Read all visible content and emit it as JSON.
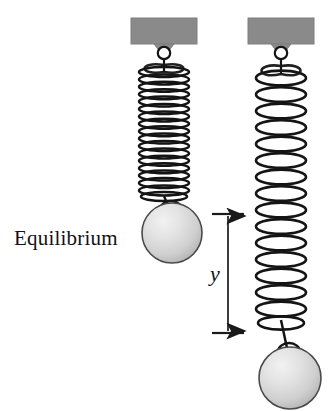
{
  "figure": {
    "background_color": "#ffffff",
    "width": 334,
    "height": 411
  },
  "labels": {
    "equilibrium": "Equilibrium",
    "displacement": "y"
  },
  "colors": {
    "support_block": "#8a8a8a",
    "support_block_edge": "#7d7d7d",
    "spring_stroke": "#141414",
    "ball_fill_light": "#ececec",
    "ball_fill_mid": "#d4d4d4",
    "ball_fill_dark": "#b4b4b4",
    "ball_outline": "#4a4a4a",
    "dimension_line": "#1a1a1a",
    "text": "#111111"
  },
  "systems": [
    {
      "name": "equilibrium-system",
      "state": "equilibrium",
      "support": {
        "x": 131,
        "y": 18,
        "width": 66,
        "height": 26
      },
      "hook": {
        "cx": 164,
        "cy": 52,
        "r": 6
      },
      "spring": {
        "center_x": 164,
        "top": 62,
        "bottom": 196,
        "coil_width": 52,
        "coil_count": 18,
        "compressed": true
      },
      "ball": {
        "cx": 172,
        "cy": 233,
        "r": 30
      }
    },
    {
      "name": "displaced-system",
      "state": "displaced",
      "support": {
        "x": 248,
        "y": 18,
        "width": 66,
        "height": 26
      },
      "hook": {
        "cx": 281,
        "cy": 52,
        "r": 6
      },
      "spring": {
        "center_x": 281,
        "top": 62,
        "bottom": 325,
        "coil_width": 52,
        "coil_count": 16,
        "compressed": false
      },
      "ball": {
        "cx": 290,
        "cy": 378,
        "r": 31
      }
    }
  ],
  "dimension": {
    "name": "displacement-dimension",
    "symbol": "y",
    "line_x": 228,
    "top_y": 214,
    "bottom_y": 333,
    "tick_left": 213,
    "tick_right": 243
  }
}
